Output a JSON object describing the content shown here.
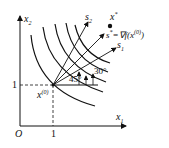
{
  "figure": {
    "axes": {
      "x_label": "x",
      "x_sub": "1",
      "y_label": "x",
      "y_sub": "2",
      "origin_label": "O",
      "x_tick": "1",
      "y_tick": "1"
    },
    "points": {
      "start_label": "x",
      "start_sup": "(0)",
      "optimum_label": "x",
      "optimum_sup": "*"
    },
    "directions": {
      "s2_label": "s",
      "s2_sub": "2",
      "s1_label": "s",
      "s1_sub": "1",
      "sstar_label": "s",
      "sstar_sup": "*",
      "sstar_eq": "=∇f(x",
      "sstar_eq_sup": "(0)",
      "sstar_close": ")"
    },
    "angles": {
      "a45": "45°",
      "a30": "30°"
    },
    "colors": {
      "ink": "#111111",
      "background": "#ffffff"
    }
  }
}
